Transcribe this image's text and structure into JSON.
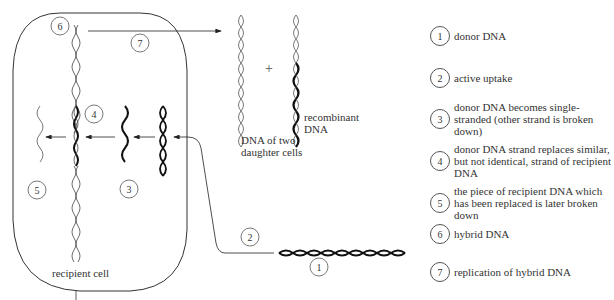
{
  "diagram": {
    "type": "bacterial-transformation",
    "cell_label": "recipient cell",
    "daughter_label": "DNA of two daughter cells",
    "daughter_label_lines": [
      "DNA of two",
      "daughter cells"
    ],
    "recombinant_label_lines": [
      "recombinant",
      "DNA"
    ],
    "plus_sign": "+",
    "markers": [
      {
        "num": "1",
        "x": 319,
        "y": 267
      },
      {
        "num": "2",
        "x": 250,
        "y": 237
      },
      {
        "num": "3",
        "x": 129,
        "y": 189
      },
      {
        "num": "4",
        "x": 94,
        "y": 114
      },
      {
        "num": "5",
        "x": 37,
        "y": 190
      },
      {
        "num": "6",
        "x": 60,
        "y": 26
      },
      {
        "num": "7",
        "x": 140,
        "y": 43
      }
    ]
  },
  "legend": [
    {
      "num": "1",
      "text": "donor DNA"
    },
    {
      "num": "2",
      "text": "active uptake"
    },
    {
      "num": "3",
      "text": "donor DNA becomes single-stranded (other strand is broken down)"
    },
    {
      "num": "4",
      "text": "donor DNA strand replaces similar, but not identical, strand of recipient DNA"
    },
    {
      "num": "5",
      "text": "the piece of recipient DNA which has been replaced is later broken down"
    },
    {
      "num": "6",
      "text": "hybrid DNA"
    },
    {
      "num": "7",
      "text": "replication of hybrid DNA"
    }
  ]
}
